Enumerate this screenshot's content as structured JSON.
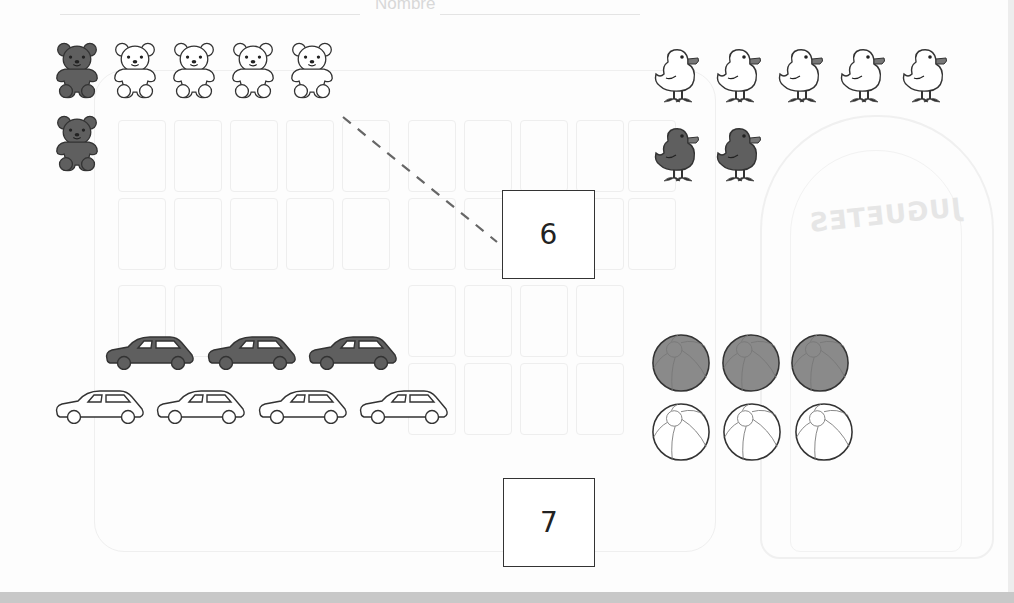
{
  "worksheet": {
    "header_label": "Nombre",
    "background_title": "JUGUETES",
    "colors": {
      "filled": "#5f5f5f",
      "filled_stroke": "#333333",
      "outline": "#ffffff",
      "outline_stroke": "#333333",
      "beak": "#777777",
      "ball_fill": "#8a8a8a",
      "box_border": "#333333",
      "dash": "#666666",
      "bottom_bar": "#c8c8c8"
    }
  },
  "groups": [
    {
      "name": "bears",
      "filled_count": 2,
      "outline_count": 4,
      "total": 6
    },
    {
      "name": "chicks",
      "filled_count": 2,
      "outline_count": 5,
      "total": 7
    },
    {
      "name": "cars",
      "filled_count": 3,
      "outline_count": 4,
      "total": 7
    },
    {
      "name": "balls",
      "filled_count": 3,
      "outline_count": 3,
      "total": 6
    }
  ],
  "answer_boxes": [
    {
      "value": "6",
      "connected_to": "bears"
    },
    {
      "value": "7",
      "connected_to": ""
    }
  ]
}
